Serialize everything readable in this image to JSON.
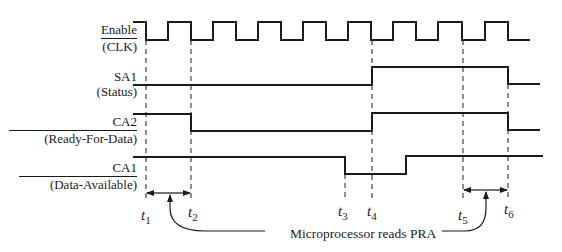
{
  "signals": [
    {
      "id": "enable",
      "name": "Enable",
      "desc": "(CLK)",
      "overline": "name"
    },
    {
      "id": "sa1",
      "name": "SA1",
      "desc": "(Status)"
    },
    {
      "id": "ca2",
      "name": "CA2",
      "desc": "(Ready-For-Data)",
      "overline": "name"
    },
    {
      "id": "ca1",
      "name": "CA1",
      "desc": "(Data-Available)",
      "overline": "name"
    }
  ],
  "time_markers": [
    {
      "id": "t1",
      "t": "t",
      "sub": "1"
    },
    {
      "id": "t2",
      "t": "t",
      "sub": "2"
    },
    {
      "id": "t3",
      "t": "t",
      "sub": "3"
    },
    {
      "id": "t4",
      "t": "t",
      "sub": "4"
    },
    {
      "id": "t5",
      "t": "t",
      "sub": "5"
    },
    {
      "id": "t6",
      "t": "t",
      "sub": "6"
    }
  ],
  "annotation": {
    "text": "Microprocessor reads PRA"
  },
  "colors": {
    "line": "#1a1a1a",
    "background": "#ffffff"
  }
}
